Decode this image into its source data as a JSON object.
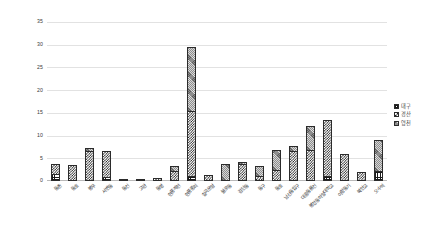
{
  "chart_data": {
    "type": "bar",
    "stacked": true,
    "title": "",
    "xlabel": "",
    "ylabel": "",
    "ylim": [
      0,
      35
    ],
    "yticks": [
      0,
      5,
      10,
      15,
      20,
      25,
      30,
      35
    ],
    "grid": true,
    "legend_position": "right",
    "categories": [
      "동촌",
      "동호",
      "봉무",
      "서변동",
      "동신",
      "고관",
      "동명",
      "현풍계천",
      "현풍중리",
      "칠곡운암",
      "불로동",
      "검단동",
      "동구",
      "동호",
      "남산동입구",
      "대흥동룡신",
      "봉정동하양대학교",
      "아량동기",
      "북안교",
      "오수역"
    ],
    "series": [
      {
        "name": "대구",
        "pattern": "grid",
        "values": [
          1.6,
          0,
          0,
          0.9,
          0,
          0,
          0,
          0,
          1.0,
          0,
          0,
          0,
          0,
          0,
          0,
          0,
          1.0,
          0,
          0,
          2.2
        ]
      },
      {
        "name": "경산",
        "pattern": "checker",
        "values": [
          2.2,
          3.6,
          6.6,
          5.8,
          0.5,
          0.5,
          0.7,
          2.3,
          14.5,
          1.4,
          0,
          3.7,
          1.1,
          2.5,
          6.6,
          6.8,
          12.5,
          6.0,
          1.9,
          0
        ]
      },
      {
        "name": "영천",
        "pattern": "stipple",
        "values": [
          0,
          0,
          0.6,
          0,
          0,
          0,
          0,
          1.1,
          14.0,
          0,
          3.7,
          0.4,
          2.1,
          4.4,
          1.2,
          5.4,
          0,
          0,
          0,
          6.8
        ]
      }
    ]
  },
  "legend": {
    "items": [
      {
        "label": "대구"
      },
      {
        "label": "경산"
      },
      {
        "label": "영천"
      }
    ]
  }
}
